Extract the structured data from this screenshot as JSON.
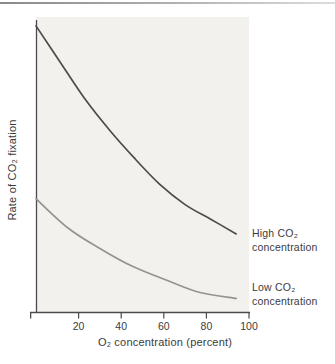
{
  "figure": {
    "top_rule": {
      "color_left": "#8a8a8a",
      "color_right": "#dddddd"
    }
  },
  "chart_data": {
    "type": "line",
    "title": "",
    "xlabel": "O₂ concentration (percent)",
    "ylabel": "Rate of CO₂ fixation",
    "xlim": [
      0,
      100
    ],
    "ylim": [
      0,
      100
    ],
    "x_ticks": [
      20,
      40,
      60,
      80,
      100
    ],
    "y_ticks": [],
    "grid": false,
    "plot_background": "#f2f1ed",
    "axis_color": "#4b4b4b",
    "tick_label_color": "#3b3b3b",
    "legend_position": "right-of-curve-ends",
    "series": [
      {
        "name": "High CO₂ concentration",
        "label_line1": "High CO₂",
        "label_line2": "concentration",
        "color": "#4e4c4a",
        "x": [
          0,
          11,
          23,
          35,
          46,
          58,
          70,
          82,
          94
        ],
        "y": [
          98,
          86,
          73,
          62,
          53,
          44,
          37,
          32,
          27
        ]
      },
      {
        "name": "Low CO₂ concentration",
        "label_line1": "Low CO₂",
        "label_line2": "concentration",
        "color": "#96938f",
        "x": [
          0,
          15,
          30,
          45,
          62,
          77,
          94
        ],
        "y": [
          39,
          29,
          22,
          16,
          11,
          7,
          5
        ]
      }
    ]
  }
}
